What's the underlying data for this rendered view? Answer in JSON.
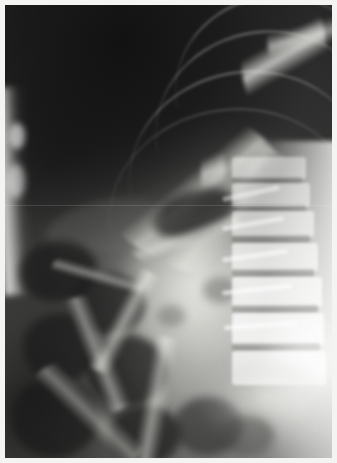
{
  "image": {
    "kind": "radiograph",
    "modality": "X-ray",
    "body_region": "Abdomen",
    "projection": "Upright / supine abdominal film (left lateral decubitus appearance)",
    "orientation": "Patient left of frame dark (gas), spine at right of frame",
    "caption": "Plain abdominal radiograph showing dilated gas-filled bowel loops with visible valvulae conniventes, a dark upper gas/lung field, a bright left flank stripe, and the lumbar vertebral column along the right margin.",
    "width_px": 337,
    "height_px": 463
  },
  "presentation": {
    "border_label": "film-border",
    "border_color": "#f4f4f2",
    "border_width_px": 5,
    "background_color": "#2c2c2c"
  },
  "palette": {
    "darkest_gas": "#161616",
    "dark_field": "#2c2c2c",
    "mid_tissue": "#5a5a57",
    "bright_bone": "#f0f0ec",
    "flank_stripe": "#ffffff"
  },
  "regions": [
    {
      "id": "upper-gas-field",
      "label": "Upper dark gas / lung base field",
      "position": "top-left and top-centre"
    },
    {
      "id": "left-flank-stripe",
      "label": "Left flank soft-tissue stripe",
      "position": "left margin"
    },
    {
      "id": "rib-cage",
      "label": "Lower rib shadows",
      "position": "top-right"
    },
    {
      "id": "bowel-loops",
      "label": "Dilated gas-filled bowel loops",
      "position": "centre and lower-left"
    },
    {
      "id": "central-mass",
      "label": "Central dense soft-tissue / fluid density",
      "position": "centre"
    },
    {
      "id": "lumbar-spine",
      "label": "Lumbar vertebral column",
      "position": "right margin"
    },
    {
      "id": "pelvis-shadow",
      "label": "Pelvic brim / sacral shadow",
      "position": "bottom-right"
    }
  ],
  "anatomy_markers": {
    "vertebrae_count": 6,
    "rib_count_visible": 5,
    "bowel_loop_count": 11
  },
  "annotations": {
    "patient_markers": "none visible",
    "text_overlay": "none visible",
    "measurement_scale": "none visible"
  }
}
